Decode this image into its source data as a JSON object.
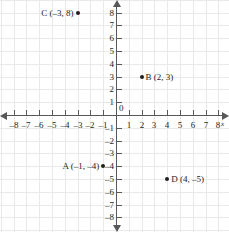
{
  "chart_data": {
    "type": "scatter",
    "title": "",
    "xlabel": "x",
    "ylabel": "",
    "xlim": [
      -8,
      8
    ],
    "ylim": [
      -8,
      8
    ],
    "grid": true,
    "legend": "none",
    "origin_label": "0",
    "x_ticks": [
      {
        "value": -8,
        "label": "–8"
      },
      {
        "value": -7,
        "label": "–7"
      },
      {
        "value": -6,
        "label": "–6"
      },
      {
        "value": -5,
        "label": "–5"
      },
      {
        "value": -4,
        "label": "–4"
      },
      {
        "value": -3,
        "label": "–3"
      },
      {
        "value": -2,
        "label": "–2"
      },
      {
        "value": -1,
        "label": "–1"
      },
      {
        "value": 1,
        "label": "1"
      },
      {
        "value": 2,
        "label": "2"
      },
      {
        "value": 3,
        "label": "3"
      },
      {
        "value": 4,
        "label": "4"
      },
      {
        "value": 5,
        "label": "5"
      },
      {
        "value": 6,
        "label": "6"
      },
      {
        "value": 7,
        "label": "7"
      },
      {
        "value": 8,
        "label": "8"
      }
    ],
    "y_ticks": [
      {
        "value": 8,
        "label": "8"
      },
      {
        "value": 7,
        "label": "7"
      },
      {
        "value": 6,
        "label": "6"
      },
      {
        "value": 5,
        "label": "5"
      },
      {
        "value": 4,
        "label": "4"
      },
      {
        "value": 3,
        "label": "3"
      },
      {
        "value": 2,
        "label": "2"
      },
      {
        "value": 1,
        "label": "1"
      },
      {
        "value": -1,
        "label": "–1"
      },
      {
        "value": -2,
        "label": "–2"
      },
      {
        "value": -3,
        "label": "–3"
      },
      {
        "value": -4,
        "label": "–4"
      },
      {
        "value": -5,
        "label": "–5"
      },
      {
        "value": -6,
        "label": "–6"
      },
      {
        "value": -7,
        "label": "–7"
      },
      {
        "value": -8,
        "label": "–8"
      }
    ],
    "points": [
      {
        "name": "C",
        "x": -3,
        "y": 8,
        "label": "C (–3, 8)",
        "label_side": "left"
      },
      {
        "name": "B",
        "x": 2,
        "y": 3,
        "label": "B (2, 3)",
        "label_side": "right"
      },
      {
        "name": "A",
        "x": -1,
        "y": -4,
        "label": "A (–1, –4)",
        "label_side": "left"
      },
      {
        "name": "D",
        "x": 4,
        "y": -5,
        "label": "D (4, –5)",
        "label_side": "right"
      }
    ]
  },
  "colors": {
    "grid": "#e9e9e9",
    "axis": "#58585a",
    "point": "#231f20",
    "text": "#231f20",
    "background": "#ffffff"
  }
}
